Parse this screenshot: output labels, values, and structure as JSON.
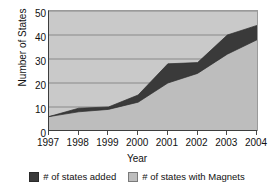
{
  "chart_data": {
    "type": "area",
    "title": "",
    "xlabel": "Year",
    "ylabel": "Number of States",
    "categories": [
      "1997",
      "1998",
      "1999",
      "2000",
      "2001",
      "2002",
      "2003",
      "2004"
    ],
    "ylim": [
      0,
      50
    ],
    "yticks": [
      0,
      10,
      20,
      30,
      40,
      50
    ],
    "grid": true,
    "legend_position": "bottom",
    "stacked": true,
    "series": [
      {
        "name": "# of states with Magnets",
        "color": "#bdbdbd",
        "values": [
          6,
          8,
          9,
          12,
          20,
          24,
          32,
          38
        ]
      },
      {
        "name": "# of states added",
        "color": "#3a3a3a",
        "values": [
          0,
          1.5,
          1,
          3,
          8,
          4.5,
          8,
          6
        ]
      }
    ],
    "cumulative_top": [
      6,
      9.5,
      10,
      15,
      28,
      28.5,
      40,
      44
    ]
  },
  "axes": {
    "y_title": "Number of States",
    "x_title": "Year",
    "y_tick_labels": [
      "50",
      "40",
      "30",
      "20",
      "10",
      "0"
    ],
    "x_tick_labels": [
      "1997",
      "1998",
      "1999",
      "2000",
      "2001",
      "2002",
      "2003",
      "2004"
    ]
  },
  "legend": {
    "items": [
      {
        "label": "# of states added",
        "swatch": "dark-square-swatch"
      },
      {
        "label": "# of states with Magnets",
        "swatch": "light-square-swatch"
      }
    ]
  },
  "colors": {
    "plot_background": "#c9c9c9",
    "series_dark": "#3a3a3a",
    "series_light": "#bdbdbd",
    "gridline": "#6e6e6e",
    "axis": "#3d3d3d"
  }
}
